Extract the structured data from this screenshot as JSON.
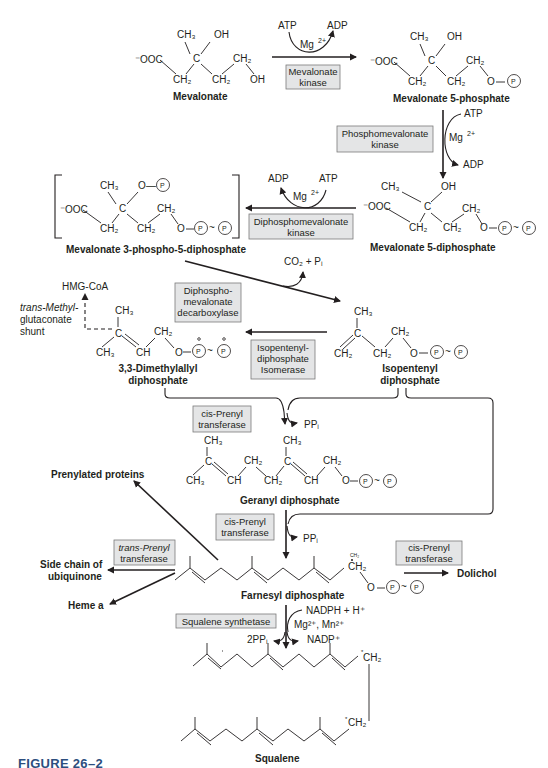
{
  "figure": {
    "caption": "FIGURE 26–2",
    "accent_color": "#2c4e7e",
    "enzyme_box_fill": "#e4e5e6"
  },
  "compounds": {
    "mevalonate": "Mevalonate",
    "mevalonate_5p": "Mevalonate 5-phosphate",
    "mevalonate_5pp": "Mevalonate 5-diphosphate",
    "mevalonate_3p5pp": "Mevalonate 3-phospho-5-diphosphate",
    "dimethylallyl_1": "3,3-Dimethylallyl",
    "dimethylallyl_2": "diphosphate",
    "isopentenyl_1": "Isopentenyl",
    "isopentenyl_2": "diphosphate",
    "geranyl": "Geranyl diphosphate",
    "farnesyl": "Farnesyl diphosphate",
    "squalene": "Squalene"
  },
  "enzymes": {
    "mevalonate_kinase": [
      "Mevalonate",
      "kinase"
    ],
    "phosphomevalonate_kinase": [
      "Phosphomevalonate",
      "kinase"
    ],
    "diphosphomevalonate_kinase": [
      "Diphosphomevalonate",
      "kinase"
    ],
    "decarboxylase": [
      "Diphospho-",
      "mevalonate",
      "decarboxylase"
    ],
    "isomerase": [
      "Isopentenyl-",
      "diphosphate",
      "Isomerase"
    ],
    "cis_prenyl_1": [
      "cis-Prenyl",
      "transferase"
    ],
    "cis_prenyl_2": [
      "cis-Prenyl",
      "transferase"
    ],
    "trans_prenyl": [
      "trans-Prenyl",
      "transferase"
    ],
    "cis_prenyl_3": [
      "cis-Prenyl",
      "transferase"
    ],
    "squalene_synthetase": "Squalene synthetase"
  },
  "cofactors": {
    "atp": "ATP",
    "adp": "ADP",
    "mg": "Mg",
    "mg_charge": "2+",
    "co2_pi": "CO₂ + Pᵢ",
    "ppi": "PPᵢ",
    "two_ppi": "2PPᵢ",
    "nadph": "NADPH + H⁺",
    "mg_mn": "Mg²⁺, Mn²⁺",
    "nadp": "NADP⁺"
  },
  "products": {
    "hmg_coa": "HMG-CoA",
    "shunt_1": "trans-Methyl-",
    "shunt_2": "glutaconate",
    "shunt_3": "shunt",
    "prenylated_proteins": "Prenylated proteins",
    "ubiquinone_1": "Side chain of",
    "ubiquinone_2": "ubiquinone",
    "heme_a": "Heme a",
    "dolichol": "Dolichol"
  },
  "groups": {
    "ch3": "CH₃",
    "ch2": "CH₂",
    "oh": "OH",
    "c": "C",
    "ch": "CH",
    "o": "O",
    "p": "P",
    "ooc": "⁻OOC",
    "tilde": "~",
    "dash": "—"
  }
}
